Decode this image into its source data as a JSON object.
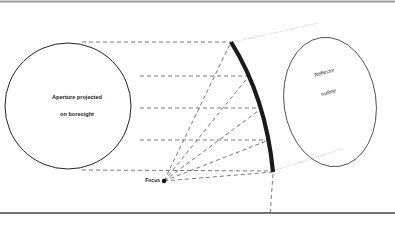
{
  "diagram": {
    "type": "reflector-antenna-geometry",
    "labels": {
      "aperture_line1": "Aperture projected",
      "aperture_line2": "on boresight",
      "reflector_line1": "Reflector",
      "reflector_line2": "outline",
      "focus": "Focus"
    },
    "colors": {
      "stroke": "#222222",
      "dashed": "#555555",
      "dotted": "#b8b8b8",
      "reflector": "#1a1a1a",
      "top_rule": "#9a9a9a",
      "bottom_rule": "#444444"
    },
    "aperture_circle": {
      "cx": 68,
      "cy": 106,
      "r": 63
    },
    "reflector_ellipse": {
      "cx": 330,
      "cy": 102,
      "rx": 46,
      "ry": 65,
      "rotate": -8
    },
    "focus_point": {
      "x": 164,
      "y": 181
    },
    "reflector_arc_points": [
      {
        "x": 231,
        "y": 42
      },
      {
        "x": 249,
        "y": 76
      },
      {
        "x": 262,
        "y": 108
      },
      {
        "x": 269,
        "y": 140
      },
      {
        "x": 273,
        "y": 172
      }
    ],
    "ray_levels_y": [
      42,
      76,
      108,
      140,
      172
    ]
  }
}
